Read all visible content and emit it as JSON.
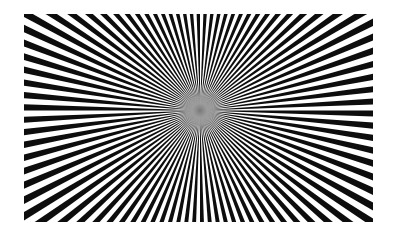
{
  "image": {
    "title": "Radial starburst test pattern",
    "kind": "siemens-star",
    "width": 397,
    "height": 240,
    "background_color": "#ffffff"
  },
  "pattern": {
    "name": "radial-sunburst",
    "frame": {
      "x": 24,
      "y": 14,
      "width": 349,
      "height": 208
    },
    "center": {
      "x": 200,
      "y": 110.5,
      "label": "convergence-point"
    },
    "ray_count": 90,
    "segment_count": 180,
    "segment_angle_degrees": 2,
    "stripe_color": "#0d0d0d",
    "gap_color": "#ffffff",
    "ray_length": 460,
    "start_angle_degrees": 0,
    "core": {
      "blur_radius": 26,
      "blur_amount": 5,
      "haze_color": "#8c8c8c",
      "inner_gray": "#9a9a9a"
    },
    "edge_counts": {
      "top_edge_stripes": 41,
      "bottom_edge_stripes": 41,
      "left_edge_stripes": 18,
      "right_edge_stripes": 18
    }
  }
}
